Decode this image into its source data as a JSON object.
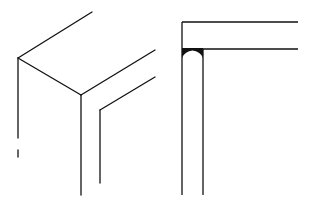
{
  "diagram": {
    "background": "#ffffff",
    "stroke_color": "#111111",
    "figures": [
      {
        "name": "isometric-corner-joint",
        "description": "Isometric line drawing of a box corner with an offset inner L-shaped edge"
      },
      {
        "name": "elevation-corner-joint",
        "description": "Elevation view of a horizontal rail meeting a vertical post with a filled arch-shaped notch"
      }
    ]
  }
}
